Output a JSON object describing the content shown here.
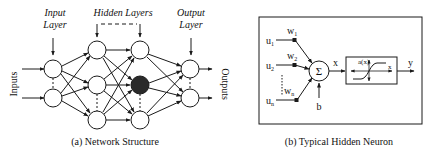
{
  "figure_a": {
    "caption": "(a) Network Structure",
    "labels": {
      "input_layer_line1": "Input",
      "input_layer_line2": "Layer",
      "hidden_layers": "Hidden Layers",
      "output_layer_line1": "Output",
      "output_layer_line2": "Layer",
      "inputs": "Inputs",
      "outputs": "Outputs"
    },
    "layers": {
      "input_nodes": 2,
      "hidden_layer_1_nodes": 3,
      "hidden_layer_2_nodes": 3,
      "output_nodes": 2,
      "highlighted_node": "hidden layer 2, middle"
    }
  },
  "figure_b": {
    "caption": "(b) Typical Hidden Neuron",
    "inputs": [
      {
        "u": "u",
        "u_sub": "1",
        "w": "w",
        "w_sub": "1"
      },
      {
        "u": "u",
        "u_sub": "2",
        "w": "w",
        "w_sub": "2"
      },
      {
        "u": "u",
        "u_sub": "n",
        "w": "w",
        "w_sub": "n"
      }
    ],
    "sum_symbol": "Σ",
    "bias": "b",
    "sum_output": "x",
    "activation_label": "a(x)",
    "activation_axis": "x",
    "output": "y"
  },
  "colors": {
    "stroke": "#1a1a1a",
    "highlight_node": "#2a2a2a",
    "background": "#ffffff"
  }
}
